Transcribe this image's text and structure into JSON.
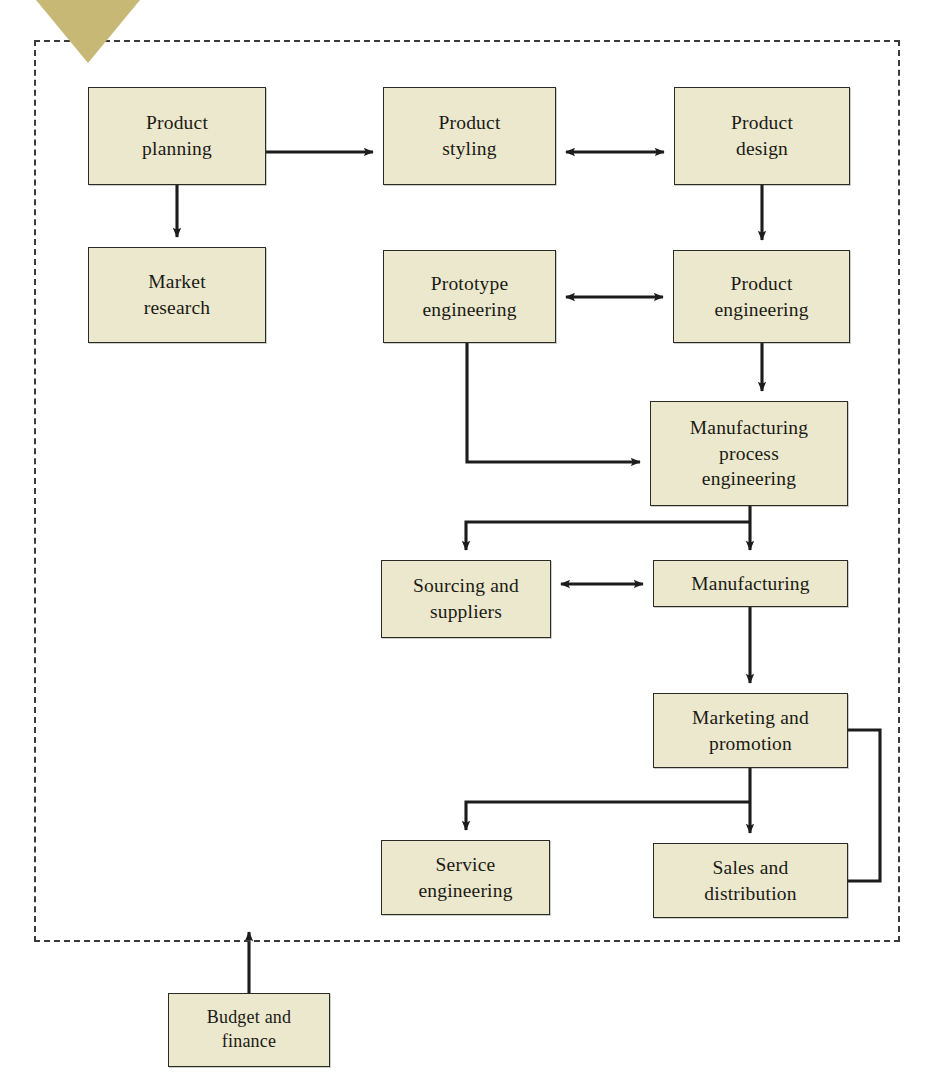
{
  "diagram": {
    "frame": {
      "name": "company-boundary",
      "style": "dashed"
    },
    "colors": {
      "node_fill": "#ece8cd",
      "node_border": "#2b2b25",
      "connector": "#1c1c1c",
      "frame_border": "#3a3a3a",
      "corner_marker": "#c8b875",
      "background": "#ffffff"
    },
    "nodes": [
      {
        "id": "product-planning",
        "label": "Product\nplanning",
        "x": 88,
        "y": 87,
        "w": 178,
        "h": 98
      },
      {
        "id": "product-styling",
        "label": "Product\nstyling",
        "x": 383,
        "y": 87,
        "w": 173,
        "h": 98
      },
      {
        "id": "product-design",
        "label": "Product\ndesign",
        "x": 674,
        "y": 87,
        "w": 176,
        "h": 98
      },
      {
        "id": "market-research",
        "label": "Market\nresearch",
        "x": 88,
        "y": 247,
        "w": 178,
        "h": 96
      },
      {
        "id": "prototype-engineering",
        "label": "Prototype\nengineering",
        "x": 383,
        "y": 250,
        "w": 173,
        "h": 93
      },
      {
        "id": "product-engineering",
        "label": "Product\nengineering",
        "x": 673,
        "y": 250,
        "w": 177,
        "h": 93
      },
      {
        "id": "manufacturing-process-engineering",
        "label": "Manufacturing\nprocess\nengineering",
        "x": 650,
        "y": 401,
        "w": 198,
        "h": 105
      },
      {
        "id": "sourcing-and-suppliers",
        "label": "Sourcing and\nsuppliers",
        "x": 381,
        "y": 560,
        "w": 170,
        "h": 78
      },
      {
        "id": "manufacturing",
        "label": "Manufacturing",
        "x": 653,
        "y": 560,
        "w": 195,
        "h": 47
      },
      {
        "id": "marketing-and-promotion",
        "label": "Marketing and\npromotion",
        "x": 653,
        "y": 693,
        "w": 195,
        "h": 75
      },
      {
        "id": "service-engineering",
        "label": "Service\nengineering",
        "x": 381,
        "y": 840,
        "w": 169,
        "h": 75
      },
      {
        "id": "sales-and-distribution",
        "label": "Sales and\ndistribution",
        "x": 653,
        "y": 843,
        "w": 195,
        "h": 75
      },
      {
        "id": "budget-and-finance",
        "label": "Budget and\nfinance",
        "x": 168,
        "y": 993,
        "w": 162,
        "h": 74
      }
    ],
    "connections": [
      {
        "id": "planning-to-styling",
        "from": "product-planning",
        "to": "product-styling",
        "arrow": "single"
      },
      {
        "id": "planning-to-market-research",
        "from": "product-planning",
        "to": "market-research",
        "arrow": "single"
      },
      {
        "id": "styling-design",
        "from": "product-styling",
        "to": "product-design",
        "arrow": "double"
      },
      {
        "id": "design-to-product-engineering",
        "from": "product-design",
        "to": "product-engineering",
        "arrow": "single"
      },
      {
        "id": "prototype-product-engineering",
        "from": "prototype-engineering",
        "to": "product-engineering",
        "arrow": "double"
      },
      {
        "id": "product-eng-to-mpe",
        "from": "product-engineering",
        "to": "manufacturing-process-engineering",
        "arrow": "single"
      },
      {
        "id": "prototype-to-mpe",
        "from": "prototype-engineering",
        "to": "manufacturing-process-engineering",
        "arrow": "single"
      },
      {
        "id": "mpe-to-manufacturing",
        "from": "manufacturing-process-engineering",
        "to": "manufacturing",
        "arrow": "single"
      },
      {
        "id": "mpe-to-sourcing",
        "from": "manufacturing-process-engineering",
        "to": "sourcing-and-suppliers",
        "arrow": "single"
      },
      {
        "id": "sourcing-manufacturing",
        "from": "sourcing-and-suppliers",
        "to": "manufacturing",
        "arrow": "double"
      },
      {
        "id": "manufacturing-to-marketing",
        "from": "manufacturing",
        "to": "marketing-and-promotion",
        "arrow": "single"
      },
      {
        "id": "marketing-to-sales",
        "from": "marketing-and-promotion",
        "to": "sales-and-distribution",
        "arrow": "single"
      },
      {
        "id": "marketing-to-service",
        "from": "marketing-and-promotion",
        "to": "service-engineering",
        "arrow": "single"
      },
      {
        "id": "sales-feedback-to-marketing",
        "from": "sales-and-distribution",
        "to": "marketing-and-promotion",
        "arrow": "none"
      },
      {
        "id": "budget-into-boundary",
        "from": "budget-and-finance",
        "to": "company-boundary",
        "arrow": "single"
      }
    ]
  }
}
